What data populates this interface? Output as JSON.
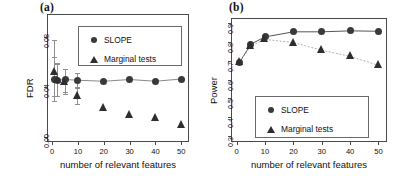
{
  "figure": {
    "panel_a_tag": "(a)",
    "panel_b_tag": "(b)"
  },
  "chart_data": [
    {
      "type": "scatter",
      "panel": "(a)",
      "title": "",
      "xlabel": "number of relevant features",
      "ylabel": "FDR",
      "xlim": [
        -2,
        53
      ],
      "ylim": [
        -0.004,
        0.098
      ],
      "xticks": [
        0,
        10,
        20,
        30,
        40,
        50
      ],
      "xticklabels": [
        "0",
        "10",
        "20",
        "30",
        "40",
        "50"
      ],
      "yticks": [
        0.0,
        0.04,
        0.08
      ],
      "yticklabels": [
        "0.00",
        "0.04",
        "0.08"
      ],
      "grid": false,
      "connect_lines": false,
      "legend": {
        "position": "top-center",
        "entries": [
          {
            "label": "SLOPE",
            "marker": "circle"
          },
          {
            "label": "Marginal tests",
            "marker": "triangle"
          }
        ]
      },
      "x": [
        1,
        2,
        5,
        10,
        20,
        30,
        40,
        50
      ],
      "series": [
        {
          "name": "SLOPE",
          "marker": "circle",
          "values": [
            0.0455,
            0.0452,
            0.0458,
            0.0452,
            0.0444,
            0.0458,
            0.0444,
            0.0462
          ],
          "err_low": [
            0.029,
            0.033,
            0.0355,
            0.039,
            null,
            null,
            null,
            null
          ],
          "err_high": [
            0.064,
            0.059,
            0.0545,
            0.051,
            null,
            null,
            null,
            null
          ]
        },
        {
          "name": "Marginal tests",
          "marker": "triangle",
          "values": [
            0.052,
            0.0452,
            0.044,
            0.033,
            0.023,
            0.0175,
            0.0152,
            0.0098
          ],
          "err_low": [
            0.033,
            0.033,
            0.0345,
            0.026,
            null,
            null,
            null,
            null
          ],
          "err_high": [
            0.077,
            0.058,
            0.0545,
            0.04,
            null,
            null,
            null,
            null
          ]
        }
      ]
    },
    {
      "type": "line",
      "panel": "(b)",
      "title": "",
      "xlabel": "number of relevant features",
      "ylabel": "Power",
      "xlim": [
        -2,
        53
      ],
      "ylim": [
        0.27,
        0.925
      ],
      "xticks": [
        0,
        10,
        20,
        30,
        40,
        50
      ],
      "xticklabels": [
        "0",
        "10",
        "20",
        "30",
        "40",
        "50"
      ],
      "yticks": [
        0.3,
        0.4,
        0.5,
        0.6,
        0.7,
        0.8,
        0.9
      ],
      "yticklabels": [
        "0.3",
        "0.4",
        "0.5",
        "0.6",
        "0.7",
        "0.8",
        "0.9"
      ],
      "grid": false,
      "connect_lines": true,
      "legend": {
        "position": "bottom-center",
        "entries": [
          {
            "label": "SLOPE",
            "marker": "circle"
          },
          {
            "label": "Marginal tests",
            "marker": "triangle"
          }
        ]
      },
      "x": [
        1,
        5,
        10,
        20,
        30,
        40,
        50
      ],
      "series": [
        {
          "name": "SLOPE",
          "marker": "circle",
          "values": [
            0.69,
            0.787,
            0.825,
            0.852,
            0.852,
            0.857,
            0.855
          ]
        },
        {
          "name": "Marginal tests",
          "marker": "triangle",
          "values": [
            0.69,
            0.778,
            0.812,
            0.795,
            0.755,
            0.722,
            0.675
          ]
        }
      ]
    }
  ]
}
